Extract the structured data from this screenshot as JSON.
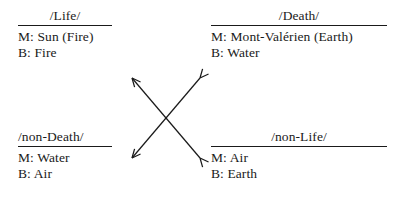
{
  "figure": {
    "type": "semiotic-square",
    "background_color": "#ffffff",
    "text_color": "#1a1a1a"
  },
  "quadrants": [
    {
      "id": "life",
      "position": "top-left",
      "heading": "/Life/",
      "lines": [
        "M: Sun (Fire)",
        "B: Fire"
      ]
    },
    {
      "id": "death",
      "position": "top-right",
      "heading": "/Death/",
      "lines": [
        "M: Mont-Valérien (Earth)",
        "B: Water"
      ]
    },
    {
      "id": "non-death",
      "position": "bottom-left",
      "heading": "/non-Death/",
      "lines": [
        "M: Water",
        "B: Air"
      ]
    },
    {
      "id": "non-life",
      "position": "bottom-right",
      "heading": "/non-Life/",
      "lines": [
        "M: Air",
        "B: Earth"
      ]
    }
  ],
  "arrows": {
    "description": "crossed double-headed diagonal arrows",
    "stroke_color": "#1a1a1a",
    "count": 2
  }
}
